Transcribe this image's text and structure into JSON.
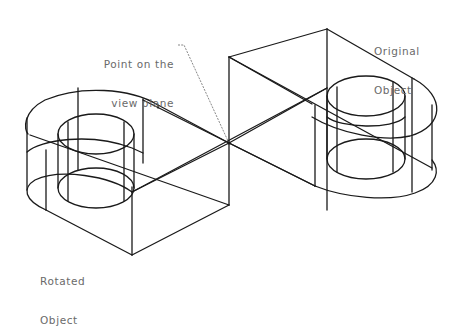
{
  "labels": {
    "view_point": {
      "line1": "Point on the",
      "line2": "view plane"
    },
    "original_object": {
      "line1": "Original",
      "line2": "Object"
    },
    "rotated_object": {
      "line1": "Rotated",
      "line2": "Object"
    }
  },
  "colors": {
    "background": "#ffffff",
    "line": "#1a1a1a",
    "label_text": "#6a6a6a"
  }
}
